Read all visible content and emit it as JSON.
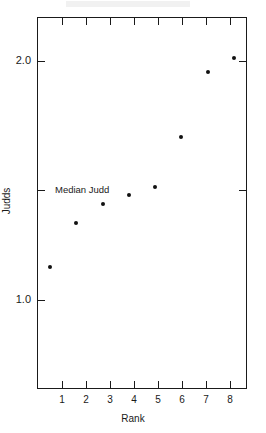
{
  "chart_data": {
    "type": "scatter",
    "title": "",
    "xlabel": "Rank",
    "ylabel": "Judds",
    "x": [
      1,
      2,
      3,
      4,
      5,
      6,
      7,
      8
    ],
    "values": [
      1.14,
      1.32,
      1.4,
      1.44,
      1.47,
      1.68,
      1.95,
      2.01
    ],
    "categories": [
      "1",
      "2",
      "3",
      "4",
      "5",
      "6",
      "7",
      "8"
    ],
    "xlim": [
      0.5,
      8.5
    ],
    "ylim": [
      0.63,
      2.18
    ],
    "xticks": [
      "1",
      "2",
      "3",
      "4",
      "5",
      "6",
      "7",
      "8"
    ],
    "yticks": [
      "1.0",
      "2.0"
    ],
    "ytick_values": [
      1.0,
      2.0
    ],
    "grid": false,
    "legend": "none",
    "annotations": [
      {
        "name": "median-judd",
        "label": "Median Judd",
        "value": 1.46,
        "type": "axis-tick-marker"
      }
    ],
    "series": [
      {
        "name": "Judds by Rank",
        "values": [
          1.14,
          1.32,
          1.4,
          1.44,
          1.47,
          1.68,
          1.95,
          2.01
        ]
      }
    ],
    "marker_color": "#111111",
    "axis_color": "#1a1a1a"
  },
  "axes": {
    "x_title": "Rank",
    "y_title": "Judds"
  },
  "median_annotation": {
    "label": "Median Judd"
  },
  "y_labels": {
    "high": "2.0",
    "low": "1.0"
  },
  "x_labels": {
    "t1": "1",
    "t2": "2",
    "t3": "3",
    "t4": "4",
    "t5": "5",
    "t6": "6",
    "t7": "7",
    "t8": "8"
  }
}
